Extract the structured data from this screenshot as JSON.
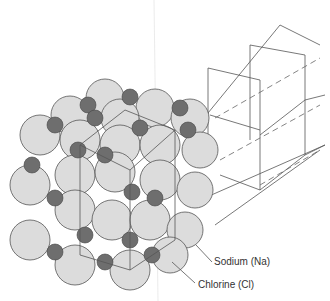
{
  "diagram": {
    "labels": {
      "sodium": "Sodium (Na)",
      "chlorine": "Chlorine (Cl)"
    },
    "colors": {
      "chlorine_fill": "#dcdcdc",
      "sodium_fill": "#6e6e6e",
      "outline": "#555555"
    }
  }
}
